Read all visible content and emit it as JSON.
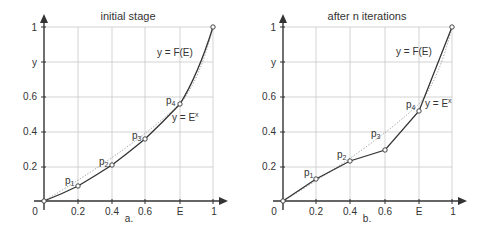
{
  "panels": [
    {
      "id": "a",
      "title": "initial stage",
      "caption": "a.",
      "origin_label": "0",
      "x_ticks": [
        "0.2",
        "0.4",
        "0.6",
        "E",
        "1"
      ],
      "y_ticks": [
        "0.2",
        "0.4",
        "0.6",
        "y",
        "1"
      ],
      "curve_label": "y = F(E)",
      "ref_label": "y = E",
      "ref_sup": "x",
      "points": [
        {
          "name": "p",
          "sub": "1",
          "x": 0.2,
          "y": 0.09
        },
        {
          "name": "p",
          "sub": "2",
          "x": 0.4,
          "y": 0.21
        },
        {
          "name": "p",
          "sub": "3",
          "x": 0.6,
          "y": 0.36
        },
        {
          "name": "p",
          "sub": "4",
          "x": 0.8,
          "y": 0.56
        }
      ]
    },
    {
      "id": "b",
      "title": "after n iterations",
      "caption": "b.",
      "origin_label": "0",
      "x_ticks": [
        "0.2",
        "0.4",
        "0.6",
        "E",
        "1"
      ],
      "y_ticks": [
        "0.2",
        "0.4",
        "0.6",
        "y",
        "1"
      ],
      "curve_label": "y = F(E)",
      "ref_label": "y = E",
      "ref_sup": "x",
      "points": [
        {
          "name": "p",
          "sub": "1",
          "x": 0.2,
          "y": 0.13
        },
        {
          "name": "p",
          "sub": "2",
          "x": 0.4,
          "y": 0.23
        },
        {
          "name": "p",
          "sub": "3",
          "x": 0.6,
          "y": 0.3
        },
        {
          "name": "p",
          "sub": "4",
          "x": 0.8,
          "y": 0.52
        }
      ]
    }
  ]
}
